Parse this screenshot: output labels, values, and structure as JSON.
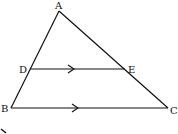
{
  "diagram": {
    "type": "triangle-with-parallel-line",
    "stroke_color": "#111111",
    "background": "#ffffff",
    "points": {
      "A": {
        "label": "A",
        "x": 59,
        "y": 11
      },
      "B": {
        "label": "B",
        "x": 11,
        "y": 108
      },
      "C": {
        "label": "C",
        "x": 168,
        "y": 108
      },
      "D": {
        "label": "D",
        "x": 30,
        "y": 69
      },
      "E": {
        "label": "E",
        "x": 125,
        "y": 69
      }
    },
    "segments": [
      {
        "from": "A",
        "to": "B"
      },
      {
        "from": "A",
        "to": "C"
      },
      {
        "from": "B",
        "to": "C",
        "parallel_mark": true
      },
      {
        "from": "D",
        "to": "E",
        "parallel_mark": true
      }
    ],
    "relation": "DE ∥ BC"
  }
}
